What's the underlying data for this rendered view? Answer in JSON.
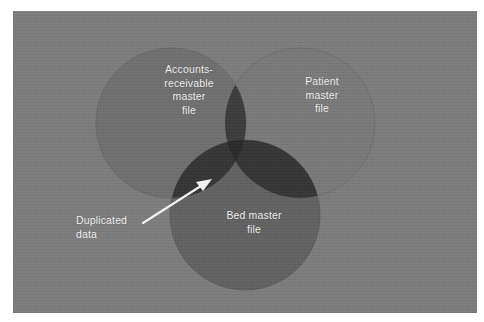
{
  "figure": {
    "type": "venn-diagram",
    "set_count": 3,
    "background_color": "#7b7b7b",
    "page_color": "#ffffff"
  },
  "sets": {
    "accounts_receivable": {
      "label": "Accounts-\nreceivable\nmaster\nfile",
      "fill_color": "#6e6e6e"
    },
    "patient": {
      "label": "Patient\nmaster\nfile",
      "fill_color": "#787878"
    },
    "bed": {
      "label": "Bed master\nfile",
      "fill_color": "#606060"
    }
  },
  "overlaps": {
    "pairwise_color": "#383838",
    "triple_color": "#272727"
  },
  "callout": {
    "label": "Duplicated\ndata",
    "arrow_color": "#f5f5f5",
    "points_to": "accounts-receivable and bed master file overlap"
  }
}
